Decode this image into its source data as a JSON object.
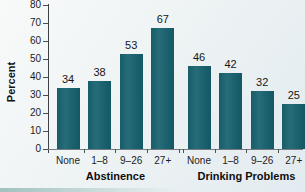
{
  "chart_data": {
    "type": "bar",
    "title": "",
    "ylabel": "Percent",
    "xlabel": "",
    "ylim": [
      0,
      80
    ],
    "yticks": [
      0,
      10,
      20,
      30,
      40,
      50,
      60,
      70,
      80
    ],
    "grid": false,
    "legend": "none",
    "bar_color": "#1e6672",
    "groups": [
      {
        "label": "Abstinence",
        "categories": [
          "None",
          "1–8",
          "9–26",
          "27+"
        ],
        "values": [
          34,
          38,
          53,
          67
        ]
      },
      {
        "label": "Drinking Problems",
        "categories": [
          "None",
          "1–8",
          "9–26",
          "27+"
        ],
        "values": [
          46,
          42,
          32,
          25
        ]
      }
    ]
  }
}
